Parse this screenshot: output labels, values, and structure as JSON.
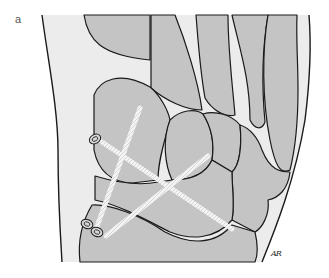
{
  "figure": {
    "panel_label": "a",
    "signature": "AR",
    "colors": {
      "bone": "#c4c4c4",
      "soft_tissue": "#ececec",
      "outline": "#1a1a1a",
      "screw": "#f2f2f2",
      "background": "#ffffff"
    },
    "screws": [
      {
        "name": "screw-1",
        "head": "upper-left medial"
      },
      {
        "name": "screw-2",
        "head": "lower-left medial"
      },
      {
        "name": "screw-3",
        "head": "lower-left medial"
      }
    ]
  }
}
